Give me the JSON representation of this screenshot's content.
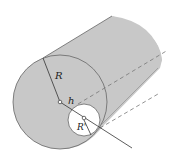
{
  "diagram": {
    "labels": {
      "outer_radius": "R",
      "offset": "h",
      "inner_radius": "R'"
    },
    "colors": {
      "fill": "#c8c8c8",
      "stroke": "#555555",
      "cavity": "#ffffff",
      "background": "#ffffff"
    }
  }
}
